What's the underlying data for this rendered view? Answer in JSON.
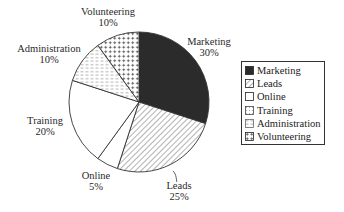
{
  "chart_data": {
    "type": "pie",
    "title": "",
    "start_angle_deg": 0,
    "direction": "clockwise",
    "slices": [
      {
        "label": "Marketing",
        "value": 30,
        "display": "30%",
        "pattern": "solid-dark",
        "color": "#2b2b2b"
      },
      {
        "label": "Leads",
        "value": 25,
        "display": "25%",
        "pattern": "diagonal-hatch",
        "color": "#555555"
      },
      {
        "label": "Online",
        "value": 5,
        "display": "5%",
        "pattern": "none",
        "color": "#ffffff"
      },
      {
        "label": "Training",
        "value": 20,
        "display": "20%",
        "pattern": "none",
        "color": "#ffffff"
      },
      {
        "label": "Administration",
        "value": 10,
        "display": "10%",
        "pattern": "horizontal-dashes",
        "color": "#888888"
      },
      {
        "label": "Volunteering",
        "value": 10,
        "display": "10%",
        "pattern": "plus-grid",
        "color": "#555555"
      }
    ],
    "legend": {
      "position": "right",
      "entries": [
        "Marketing",
        "Leads",
        "Online",
        "Training",
        "Administration",
        "Volunteering"
      ]
    }
  },
  "labels": {
    "marketing": {
      "name": "Marketing",
      "pct": "30%"
    },
    "leads": {
      "name": "Leads",
      "pct": "25%"
    },
    "online": {
      "name": "Online",
      "pct": "5%"
    },
    "training": {
      "name": "Training",
      "pct": "20%"
    },
    "administration": {
      "name": "Administration",
      "pct": "10%"
    },
    "volunteering": {
      "name": "Volunteering",
      "pct": "10%"
    }
  },
  "legend": {
    "items": [
      {
        "label": "Marketing"
      },
      {
        "label": "Leads"
      },
      {
        "label": "Online"
      },
      {
        "label": "Training"
      },
      {
        "label": "Administration"
      },
      {
        "label": "Volunteering"
      }
    ]
  }
}
